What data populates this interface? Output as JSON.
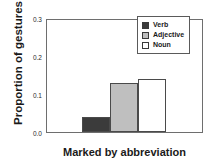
{
  "chart_data": {
    "type": "bar",
    "title": "",
    "xlabel": "Marked by abbreviation",
    "ylabel": "Proportion of gestures",
    "categories": [
      "Verb",
      "Adjective",
      "Noun"
    ],
    "values": [
      0.04,
      0.13,
      0.14
    ],
    "ylim": [
      0.0,
      0.3
    ],
    "yticks": [
      "0.0",
      "0.1",
      "0.2",
      "0.3"
    ],
    "ytick_values": [
      0.0,
      0.1,
      0.2,
      0.3
    ],
    "xticks": [],
    "grid": false,
    "legend_position": "top-right",
    "series": [
      {
        "name": "Verb",
        "value": 0.04,
        "color": "#3b3b3b"
      },
      {
        "name": "Adjective",
        "value": 0.13,
        "color": "#bfbfbf"
      },
      {
        "name": "Noun",
        "value": 0.14,
        "color": "#ffffff"
      }
    ]
  },
  "legend": {
    "entries": [
      {
        "label": "Verb",
        "color": "#3b3b3b"
      },
      {
        "label": "Adjective",
        "color": "#bfbfbf"
      },
      {
        "label": "Noun",
        "color": "#ffffff"
      }
    ]
  },
  "colors": {
    "verb": "#3b3b3b",
    "adjective": "#bfbfbf",
    "noun": "#ffffff",
    "axis": "#6e6e6e",
    "text": "#1a1a1a",
    "background": "#ffffff"
  }
}
